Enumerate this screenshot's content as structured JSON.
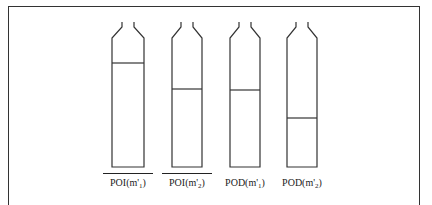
{
  "figure": {
    "bottles": [
      {
        "id": "poi-m1",
        "label_main": "POI(m'",
        "label_sub": "1",
        "label_end": ")",
        "overline": true,
        "x": 112,
        "width": 32,
        "fill_y": 63
      },
      {
        "id": "poi-m2",
        "label_main": "POI(m'",
        "label_sub": "2",
        "label_end": ")",
        "overline": true,
        "x": 172,
        "width": 30,
        "fill_y": 89
      },
      {
        "id": "pod-m1",
        "label_main": "POD(m'",
        "label_sub": "1",
        "label_end": ")",
        "overline": false,
        "x": 230,
        "width": 30,
        "fill_y": 90
      },
      {
        "id": "pod-m2",
        "label_main": "POD(m'",
        "label_sub": "2",
        "label_end": ")",
        "overline": false,
        "x": 287,
        "width": 30,
        "fill_y": 118
      }
    ],
    "bottle_top": 22,
    "bottle_shoulder": 38,
    "bottle_bottom": 167,
    "stroke_color": "#333333"
  }
}
